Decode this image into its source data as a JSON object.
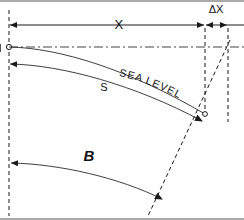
{
  "diagram": {
    "labels": {
      "x": "X",
      "delta_x": "ΔX",
      "s": "S",
      "beta": "B",
      "sea_level": "SEA  LEVEL"
    },
    "colors": {
      "line": "#1a1a1a",
      "background": "#ffffff",
      "frame": "#555555"
    },
    "annotations": [
      {
        "name": "x-dimension",
        "label": "X",
        "from_x": 9,
        "to_x": 205,
        "y": 25
      },
      {
        "name": "delta-x-dimension",
        "label": "ΔX",
        "from_x": 205,
        "to_x": 228,
        "y": 25
      },
      {
        "name": "s-dimension",
        "label": "S",
        "from_x": 9,
        "to_x": 203,
        "y_start": 64
      },
      {
        "name": "beta-dimension",
        "label": "B",
        "from_x": 9,
        "to_x": 163,
        "y_start": 163
      },
      {
        "name": "sea-level-line",
        "label": "SEA  LEVEL",
        "y": 47
      }
    ]
  }
}
